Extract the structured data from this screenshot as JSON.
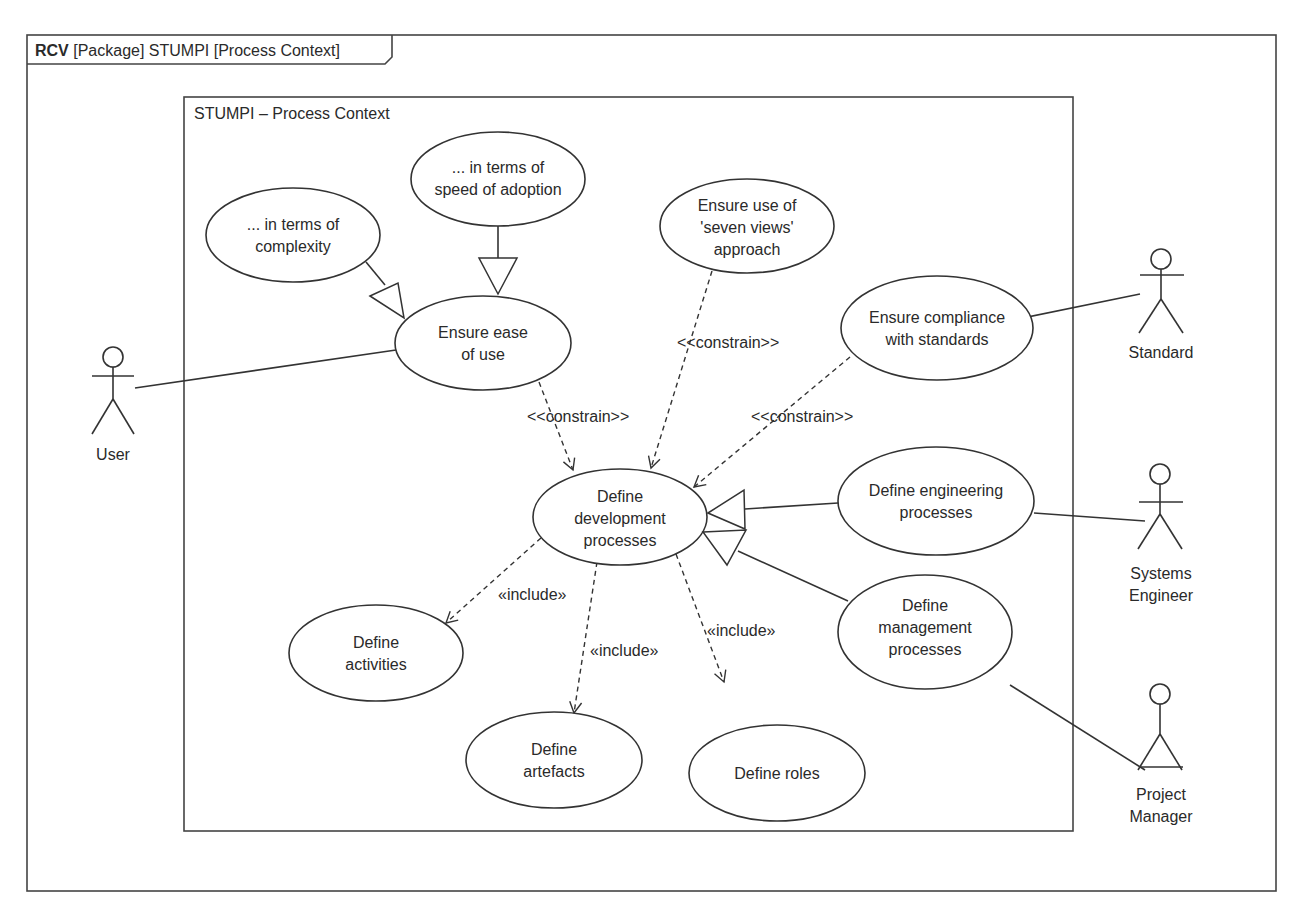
{
  "frame": {
    "title_keyword": "RCV",
    "title_rest": " [Package] STUMPI [Process Context]"
  },
  "system_boundary": {
    "label": "STUMPI – Process Context"
  },
  "use_cases": {
    "complexity": [
      "... in terms of",
      "complexity"
    ],
    "speed": [
      "... in terms of",
      "speed of adoption"
    ],
    "ease": [
      "Ensure ease",
      "of use"
    ],
    "seven_views": [
      "Ensure use of",
      "'seven views'",
      "approach"
    ],
    "compliance": [
      "Ensure compliance",
      "with standards"
    ],
    "development": [
      "Define",
      "development",
      "processes"
    ],
    "engineering": [
      "Define engineering",
      "processes"
    ],
    "management": [
      "Define",
      "management",
      "processes"
    ],
    "activities": [
      "Define",
      "activities"
    ],
    "artefacts": [
      "Define",
      "artefacts"
    ],
    "roles": [
      "Define roles"
    ]
  },
  "actors": {
    "user": [
      "User"
    ],
    "standard": [
      "Standard"
    ],
    "systems_engineer": [
      "Systems",
      "Engineer"
    ],
    "project_manager": [
      "Project",
      "Manager"
    ]
  },
  "stereotypes": {
    "constrain_ease": "<<constrain>>",
    "constrain_views": "<<constrain>>",
    "constrain_compliance": "<<constrain>>",
    "include_activities": "«include»",
    "include_artefacts": "«include»",
    "include_roles": "«include»"
  }
}
